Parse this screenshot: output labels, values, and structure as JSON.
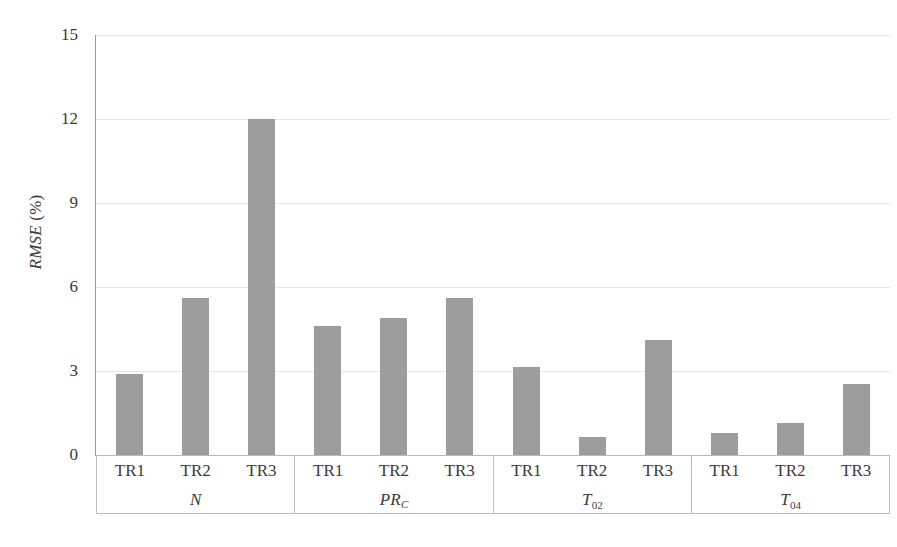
{
  "chart_data": {
    "type": "bar",
    "title": "",
    "xlabel": "",
    "ylabel": "RMSE (%)",
    "ylabel_italic_part": "RMSE",
    "ylabel_plain_part": " (%)",
    "ylim": [
      0,
      15
    ],
    "ytick_values": [
      15,
      12,
      9,
      6,
      3,
      0
    ],
    "ytick_labels": [
      "15",
      "12",
      "9",
      "6",
      "3",
      "0"
    ],
    "grid": true,
    "grid_axis": "y",
    "legend": "none",
    "bar_color": "#9d9d9d",
    "categories": [
      "TR1",
      "TR2",
      "TR3"
    ],
    "groups": [
      {
        "name": "N",
        "name_base": "N",
        "name_sub": "",
        "values": [
          2.9,
          5.6,
          12.0
        ],
        "bars": [
          {
            "category": "TR1",
            "value": 2.9
          },
          {
            "category": "TR2",
            "value": 5.6
          },
          {
            "category": "TR3",
            "value": 12.0
          }
        ]
      },
      {
        "name": "PR_C",
        "name_base": "PR",
        "name_sub": "C",
        "name_sub_italic": true,
        "values": [
          4.6,
          4.9,
          5.6
        ],
        "bars": [
          {
            "category": "TR1",
            "value": 4.6
          },
          {
            "category": "TR2",
            "value": 4.9
          },
          {
            "category": "TR3",
            "value": 5.6
          }
        ]
      },
      {
        "name": "T_02",
        "name_base": "T",
        "name_sub": "02",
        "name_sub_italic": false,
        "values": [
          3.15,
          0.65,
          4.1
        ],
        "bars": [
          {
            "category": "TR1",
            "value": 3.15
          },
          {
            "category": "TR2",
            "value": 0.65
          },
          {
            "category": "TR3",
            "value": 4.1
          }
        ]
      },
      {
        "name": "T_04",
        "name_base": "T",
        "name_sub": "04",
        "name_sub_italic": false,
        "values": [
          0.78,
          1.15,
          2.55
        ],
        "bars": [
          {
            "category": "TR1",
            "value": 0.78
          },
          {
            "category": "TR2",
            "value": 1.15
          },
          {
            "category": "TR3",
            "value": 2.55
          }
        ]
      }
    ]
  },
  "axis": {
    "y_title_italic": "RMSE",
    "y_title_rest": " (%)",
    "ticks": [
      "15",
      "12",
      "9",
      "6",
      "3",
      "0"
    ]
  }
}
